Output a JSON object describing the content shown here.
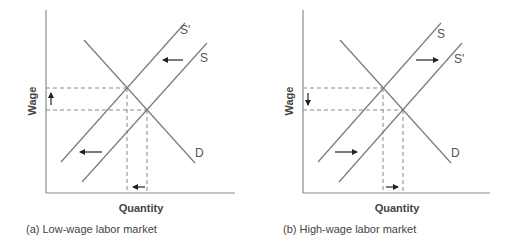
{
  "panels": [
    {
      "id": "a",
      "caption": "(a) Low-wage labor market",
      "x_axis_label": "Quantity",
      "y_axis_label": "Wage",
      "curve_labels": {
        "supply_new": "S'",
        "supply": "S",
        "demand": "D"
      },
      "shift_direction": "left",
      "wage_change": "up",
      "quantity_change": "down"
    },
    {
      "id": "b",
      "caption": "(b) High-wage labor market",
      "x_axis_label": "Quantity",
      "y_axis_label": "Wage",
      "curve_labels": {
        "supply": "S",
        "supply_new": "S'",
        "demand": "D"
      },
      "shift_direction": "right",
      "wage_change": "down",
      "quantity_change": "up"
    }
  ],
  "colors": {
    "lines": "#7a7a7a",
    "arrows": "#222222",
    "text": "#444444"
  }
}
